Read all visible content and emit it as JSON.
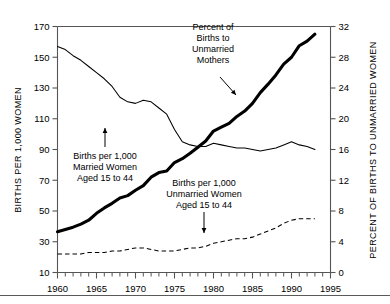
{
  "chart_data": {
    "type": "line",
    "title": "",
    "subtitle": "",
    "xlabel": "",
    "ylabel": "BIRTHS PER 1,000 WOMEN",
    "y2label": "PERCENT OF BIRTHS TO UNMARRIED WOMEN",
    "xlim": [
      1960,
      1995
    ],
    "ylim": [
      10,
      170
    ],
    "y2lim": [
      0,
      32
    ],
    "xticks": [
      1960,
      1965,
      1970,
      1975,
      1980,
      1985,
      1990,
      1995
    ],
    "xtick_labels": [
      "1960",
      "1965",
      "1970",
      "1975",
      "1980",
      "1985",
      "1990",
      "1995"
    ],
    "xminor_step": 1,
    "yticks": [
      10,
      30,
      50,
      70,
      90,
      110,
      130,
      150,
      170
    ],
    "ytick_labels": [
      "10",
      "30",
      "50",
      "70",
      "90",
      "110",
      "130",
      "150",
      "170"
    ],
    "y2ticks": [
      0,
      4,
      8,
      12,
      16,
      20,
      24,
      28,
      32
    ],
    "y2tick_labels": [
      "0",
      "4",
      "8",
      "12",
      "16",
      "20",
      "24",
      "28",
      "32"
    ],
    "grid": false,
    "legend": "none",
    "series": [
      {
        "name": "Births per 1,000 Married Women Aged 15 to 44",
        "axis": "left",
        "style": "thin-solid",
        "x": [
          1960,
          1961,
          1962,
          1963,
          1964,
          1965,
          1966,
          1967,
          1968,
          1969,
          1970,
          1971,
          1972,
          1973,
          1974,
          1975,
          1976,
          1977,
          1978,
          1979,
          1980,
          1981,
          1982,
          1983,
          1984,
          1985,
          1986,
          1987,
          1988,
          1989,
          1990,
          1991,
          1992,
          1993
        ],
        "values": [
          157,
          155,
          151,
          148,
          144,
          140,
          136,
          131,
          124,
          121,
          120,
          122,
          121,
          117,
          113,
          103,
          95,
          93,
          92,
          92,
          94,
          93,
          92,
          91,
          91,
          90,
          89,
          90,
          91,
          93,
          95,
          93,
          92,
          90
        ]
      },
      {
        "name": "Births per 1,000 Unmarried Women Aged 15 to 44",
        "axis": "left",
        "style": "dashed",
        "x": [
          1960,
          1961,
          1962,
          1963,
          1964,
          1965,
          1966,
          1967,
          1968,
          1969,
          1970,
          1971,
          1972,
          1973,
          1974,
          1975,
          1976,
          1977,
          1978,
          1979,
          1980,
          1981,
          1982,
          1983,
          1984,
          1985,
          1986,
          1987,
          1988,
          1989,
          1990,
          1991,
          1992,
          1993
        ],
        "values": [
          22,
          22,
          22,
          22,
          23,
          23,
          23,
          24,
          24,
          25,
          26,
          26,
          25,
          24,
          24,
          24,
          25,
          26,
          26,
          27,
          29,
          30,
          31,
          32,
          32,
          33,
          35,
          37,
          39,
          42,
          44,
          45,
          45,
          45
        ]
      },
      {
        "name": "Percent of Births to Unmarried Mothers",
        "axis": "right",
        "style": "thick-solid",
        "x": [
          1960,
          1961,
          1962,
          1963,
          1964,
          1965,
          1966,
          1967,
          1968,
          1969,
          1970,
          1971,
          1972,
          1973,
          1974,
          1975,
          1976,
          1977,
          1978,
          1979,
          1980,
          1981,
          1982,
          1983,
          1984,
          1985,
          1986,
          1987,
          1988,
          1989,
          1990,
          1991,
          1992,
          1993
        ],
        "values": [
          5.3,
          5.6,
          5.9,
          6.3,
          6.8,
          7.7,
          8.4,
          9.0,
          9.7,
          10.0,
          10.7,
          11.3,
          12.4,
          13.0,
          13.2,
          14.3,
          14.8,
          15.5,
          16.3,
          17.1,
          18.4,
          18.9,
          19.4,
          20.3,
          21.0,
          22.0,
          23.4,
          24.5,
          25.7,
          27.1,
          28.0,
          29.5,
          30.1,
          31.0
        ]
      }
    ],
    "annotations": [
      {
        "id": "married-annotation",
        "lines": [
          "Births per 1,000",
          "Married Women",
          "Aged 15 to 44"
        ],
        "points_to_year": 1967,
        "points_to_value": 120
      },
      {
        "id": "unmarried-annotation",
        "lines": [
          "Births per 1,000",
          "Unmarried Women",
          "Aged 15 to 44"
        ],
        "points_to_year": 1980,
        "points_to_value": 29
      },
      {
        "id": "percent-annotation",
        "lines": [
          "Percent of",
          "Births to",
          "Unmarried",
          "Mothers"
        ],
        "points_to_year": 1982,
        "points_to_value": 19.4
      }
    ]
  }
}
